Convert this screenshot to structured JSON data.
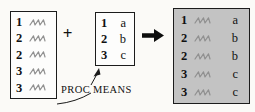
{
  "figure": {
    "annotation_label": "PROC MEANS",
    "plus_operator": "+"
  },
  "detail_table": {
    "rows": [
      {
        "key": "1"
      },
      {
        "key": "2"
      },
      {
        "key": "2"
      },
      {
        "key": "3"
      },
      {
        "key": "3"
      }
    ]
  },
  "summary_table": {
    "rows": [
      {
        "key": "1",
        "value": "a"
      },
      {
        "key": "2",
        "value": "b"
      },
      {
        "key": "3",
        "value": "c"
      }
    ]
  },
  "merged_table": {
    "rows": [
      {
        "key": "1",
        "value": "a"
      },
      {
        "key": "2",
        "value": "b"
      },
      {
        "key": "2",
        "value": "b"
      },
      {
        "key": "3",
        "value": "c"
      },
      {
        "key": "3",
        "value": "c"
      }
    ]
  },
  "colors": {
    "merged_fill": "#c3c3c3",
    "squiggle": "#909090",
    "border": "#1c1c1c",
    "text": "#111111",
    "background": "#fbfaf7"
  }
}
